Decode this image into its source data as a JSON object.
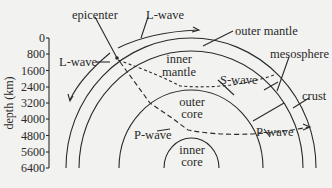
{
  "diagram": {
    "axis": {
      "label": "depth (km)",
      "ticks": [
        "0",
        "800",
        "1600",
        "2400",
        "3200",
        "4000",
        "4800",
        "5600",
        "6400"
      ]
    },
    "labels": {
      "epicenter": "epicenter",
      "l_wave_top": "L-wave",
      "l_wave_left": "L-wave",
      "outer_mantle": "outer mantle",
      "inner_mantle_1": "inner",
      "inner_mantle_2": "mantle",
      "mesosphere": "mesosphere",
      "s_wave": "S-wave",
      "crust": "crust",
      "outer_core_1": "outer",
      "outer_core_2": "core",
      "p_wave_left": "P-wave",
      "p_wave_right": "P-wave",
      "inner_core_1": "inner",
      "inner_core_2": "core"
    },
    "colors": {
      "background": "#f2f2f0",
      "line": "#2a2a2a"
    }
  }
}
